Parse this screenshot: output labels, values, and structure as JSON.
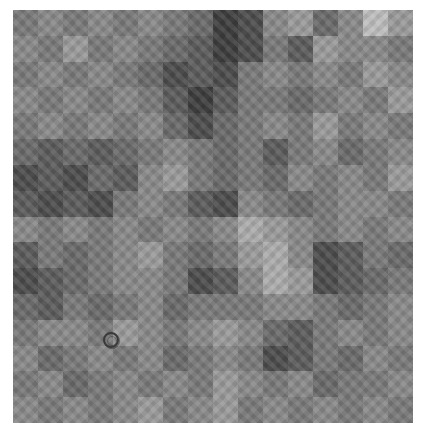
{
  "image": {
    "description": "Grayscale fractal checkerboard-like texture with a small circular marker",
    "grid": {
      "cols": 16,
      "rows": 16
    },
    "palette": [
      "#2e2e2e",
      "#3d3d3d",
      "#4c4c4c",
      "#5b5b5b",
      "#6a6a6a",
      "#797979",
      "#898989",
      "#9a9a9a",
      "#acacac",
      "#bebebe"
    ],
    "tones": [
      [
        5,
        6,
        5,
        6,
        5,
        6,
        5,
        4,
        1,
        2,
        6,
        7,
        4,
        6,
        9,
        7
      ],
      [
        6,
        5,
        7,
        5,
        6,
        5,
        4,
        3,
        1,
        2,
        5,
        3,
        7,
        6,
        6,
        5
      ],
      [
        5,
        6,
        5,
        6,
        5,
        4,
        2,
        3,
        2,
        5,
        6,
        5,
        6,
        5,
        7,
        6
      ],
      [
        6,
        5,
        6,
        5,
        6,
        5,
        3,
        1,
        3,
        5,
        5,
        4,
        5,
        6,
        5,
        7
      ],
      [
        5,
        6,
        5,
        6,
        5,
        6,
        4,
        2,
        4,
        5,
        6,
        5,
        7,
        5,
        6,
        5
      ],
      [
        4,
        3,
        4,
        3,
        4,
        5,
        6,
        5,
        4,
        5,
        3,
        5,
        6,
        4,
        5,
        6
      ],
      [
        2,
        3,
        2,
        4,
        3,
        6,
        7,
        5,
        4,
        5,
        4,
        6,
        5,
        6,
        5,
        7
      ],
      [
        3,
        2,
        3,
        2,
        5,
        6,
        5,
        3,
        2,
        6,
        5,
        4,
        5,
        6,
        6,
        5
      ],
      [
        6,
        5,
        6,
        5,
        6,
        5,
        6,
        5,
        6,
        8,
        7,
        6,
        5,
        6,
        5,
        6
      ],
      [
        3,
        5,
        4,
        5,
        6,
        7,
        5,
        4,
        5,
        7,
        8,
        6,
        2,
        3,
        5,
        4
      ],
      [
        2,
        3,
        4,
        5,
        6,
        6,
        5,
        2,
        3,
        6,
        8,
        7,
        2,
        3,
        4,
        5
      ],
      [
        4,
        3,
        5,
        4,
        5,
        6,
        4,
        5,
        5,
        5,
        6,
        6,
        5,
        4,
        5,
        6
      ],
      [
        5,
        6,
        6,
        5,
        7,
        6,
        5,
        6,
        7,
        6,
        4,
        3,
        5,
        6,
        5,
        6
      ],
      [
        6,
        4,
        5,
        6,
        5,
        6,
        4,
        5,
        6,
        5,
        2,
        3,
        5,
        4,
        6,
        5
      ],
      [
        5,
        6,
        4,
        5,
        6,
        5,
        6,
        5,
        7,
        6,
        5,
        6,
        4,
        5,
        5,
        6
      ],
      [
        6,
        5,
        6,
        5,
        6,
        7,
        5,
        6,
        7,
        5,
        6,
        5,
        6,
        5,
        6,
        5
      ]
    ],
    "marker": {
      "shape": "circle",
      "center_x": 111,
      "center_y": 340,
      "radius": 8
    }
  }
}
